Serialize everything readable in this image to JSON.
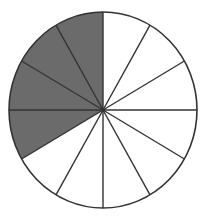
{
  "diagram": {
    "type": "fraction-circle",
    "total_slices": 12,
    "shaded_slices": 4,
    "fraction_shaded": "4/12",
    "shaded_from": "12 o'clock counter-clockwise to 8 o'clock",
    "colors": {
      "shaded_fill": "#6b6b6b",
      "unshaded_fill": "#ffffff",
      "stroke": "#333333"
    },
    "geometry": {
      "cx": 103,
      "cy": 110,
      "rx": 94,
      "ry": 98
    }
  }
}
